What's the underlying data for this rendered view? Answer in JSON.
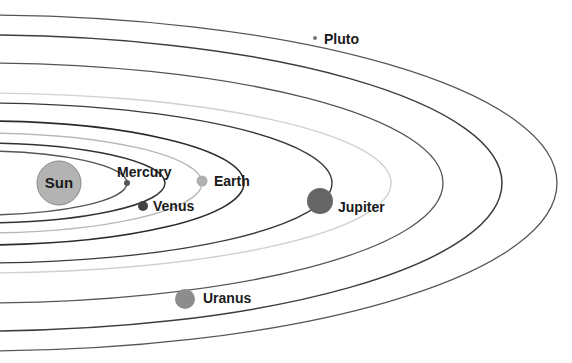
{
  "center": {
    "cx": -20,
    "cy": 183
  },
  "sun": {
    "label": "Sun",
    "cx": 59,
    "cy": 183,
    "r": 22,
    "color": "#b3b3b3",
    "stroke": "#8a8a8a"
  },
  "orbits": [
    {
      "name": "mercury",
      "rx": 147,
      "ry": 32,
      "stroke": "#555555",
      "width": 1.4
    },
    {
      "name": "venus",
      "rx": 185,
      "ry": 40,
      "stroke": "#333333",
      "width": 1.5
    },
    {
      "name": "earth",
      "rx": 222,
      "ry": 50,
      "stroke": "#b8b8b8",
      "width": 1.4
    },
    {
      "name": "mars",
      "rx": 264,
      "ry": 62,
      "stroke": "#2b2b2b",
      "width": 1.6
    },
    {
      "name": "jupiter",
      "rx": 352,
      "ry": 80,
      "stroke": "#3a3a3a",
      "width": 1.4
    },
    {
      "name": "saturn",
      "rx": 411,
      "ry": 90,
      "stroke": "#d0d0d0",
      "width": 1.4
    },
    {
      "name": "uranus",
      "rx": 463,
      "ry": 120,
      "stroke": "#555555",
      "width": 1.3
    },
    {
      "name": "neptune",
      "rx": 522,
      "ry": 148,
      "stroke": "#3d3d3d",
      "width": 1.5
    },
    {
      "name": "pluto",
      "rx": 577,
      "ry": 168,
      "stroke": "#555555",
      "width": 1.3
    }
  ],
  "planets": [
    {
      "name": "mercury",
      "label": "Mercury",
      "cx": 127,
      "cy": 183,
      "r": 3,
      "color": "#555555",
      "lx": 117,
      "ly": 177
    },
    {
      "name": "venus",
      "label": "Venus",
      "cx": 143,
      "cy": 206,
      "r": 5,
      "color": "#444444",
      "lx": 153,
      "ly": 211
    },
    {
      "name": "earth",
      "label": "Earth",
      "cx": 202,
      "cy": 181,
      "r": 5.5,
      "color": "#b0b0b0",
      "lx": 214,
      "ly": 186
    },
    {
      "name": "jupiter",
      "label": "Jupiter",
      "cx": 320,
      "cy": 201,
      "r": 13,
      "color": "#666666",
      "lx": 338,
      "ly": 212
    },
    {
      "name": "uranus",
      "label": "Uranus",
      "cx": 185,
      "cy": 299,
      "r": 10,
      "color": "#8c8c8c",
      "lx": 203,
      "ly": 303
    },
    {
      "name": "pluto",
      "label": "Pluto",
      "cx": 315,
      "cy": 38,
      "r": 2,
      "color": "#777777",
      "lx": 324,
      "ly": 44
    }
  ]
}
